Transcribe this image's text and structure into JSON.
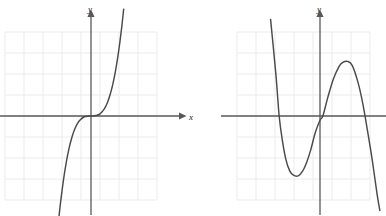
{
  "page": {
    "background_color": "#ffffff",
    "width": 386,
    "height": 216
  },
  "style": {
    "grid_color": "#e9e9ee",
    "axis_color": "#585858",
    "curve_color": "#4a4a4a",
    "label_color": "#222222"
  },
  "chart_data": [
    {
      "id": "left-graph",
      "type": "line",
      "title": "",
      "xlabel": "x",
      "ylabel": "y",
      "xlim": [
        -4.5,
        4.5
      ],
      "ylim": [
        -4.5,
        4.5
      ],
      "grid": true,
      "grid_step": 1,
      "axes_arrows": {
        "x_positive": true,
        "y_positive": true
      },
      "curve_shape": "cubic-increasing",
      "series": [
        {
          "name": "y = x^3",
          "x": [
            -1.72,
            -1.6,
            -1.45,
            -1.3,
            -1.15,
            -1.0,
            -0.85,
            -0.7,
            -0.55,
            -0.4,
            -0.25,
            -0.1,
            0.0,
            0.1,
            0.25,
            0.4,
            0.55,
            0.7,
            0.85,
            1.0,
            1.15,
            1.3,
            1.45,
            1.6,
            1.72
          ],
          "y": [
            -5.09,
            -4.1,
            -3.05,
            -2.2,
            -1.52,
            -1.0,
            -0.61,
            -0.34,
            -0.17,
            -0.06,
            -0.02,
            0.0,
            0.0,
            0.0,
            0.02,
            0.06,
            0.17,
            0.34,
            0.61,
            1.0,
            1.52,
            2.2,
            3.05,
            4.1,
            5.09
          ]
        }
      ]
    },
    {
      "id": "right-graph",
      "type": "line",
      "title": "",
      "xlabel": "x",
      "ylabel": "y",
      "xlim": [
        -4.5,
        4.5
      ],
      "ylim": [
        -4.5,
        4.5
      ],
      "grid": true,
      "grid_step": 1,
      "axes_arrows": {
        "x_positive": true,
        "y_positive": true
      },
      "curve_shape": "cubic-decreasing",
      "series": [
        {
          "name": "negative leading coefficient cubic",
          "x_intercepts": [
            -2.15,
            0.15,
            2.75
          ],
          "local_minimum": [
            -1.15,
            -2.85
          ],
          "local_maximum": [
            1.45,
            2.6
          ],
          "x": [
            -2.6,
            -2.45,
            -2.3,
            -2.15,
            -2.0,
            -1.8,
            -1.6,
            -1.4,
            -1.15,
            -0.9,
            -0.7,
            -0.5,
            -0.25,
            0.0,
            0.15,
            0.4,
            0.7,
            1.0,
            1.2,
            1.45,
            1.7,
            2.0,
            2.25,
            2.5,
            2.75,
            3.0,
            3.15
          ],
          "y": [
            4.6,
            3.2,
            1.75,
            0.0,
            -1.05,
            -2.05,
            -2.6,
            -2.82,
            -2.85,
            -2.6,
            -2.2,
            -1.65,
            -0.8,
            -0.2,
            0.0,
            0.85,
            1.75,
            2.35,
            2.55,
            2.6,
            2.4,
            1.6,
            0.6,
            -0.7,
            -2.1,
            -3.7,
            -4.5
          ]
        }
      ]
    }
  ],
  "labels": {
    "left_y": "y",
    "left_x": "x",
    "right_y": "y",
    "right_x": "x"
  }
}
